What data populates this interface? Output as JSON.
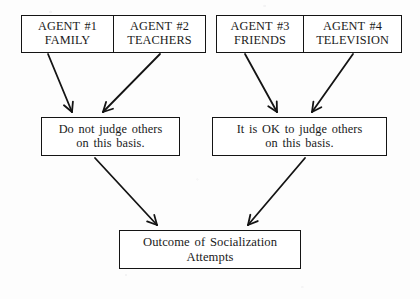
{
  "diagram": {
    "background_color": "#fdfdfd",
    "line_color": "#141414",
    "text_color": "#1a1a1a",
    "agents": [
      {
        "id": "agent-1",
        "label_top": "AGENT #1",
        "label_bottom": "FAMILY",
        "x": 21,
        "y": 15,
        "width": 93,
        "height": 38
      },
      {
        "id": "agent-2",
        "label_top": "AGENT #2",
        "label_bottom": "TEACHERS",
        "x": 113,
        "y": 15,
        "width": 93,
        "height": 38
      },
      {
        "id": "agent-3",
        "label_top": "AGENT #3",
        "label_bottom": "FRIENDS",
        "x": 216,
        "y": 15,
        "width": 88,
        "height": 38
      },
      {
        "id": "agent-4",
        "label_top": "AGENT #4",
        "label_bottom": "TELEVISION",
        "x": 303,
        "y": 15,
        "width": 99,
        "height": 38
      }
    ],
    "rules": [
      {
        "id": "rule-do-not-judge",
        "line_top": "Do not judge others",
        "line_bottom": "on this basis.",
        "x": 41,
        "y": 117,
        "width": 139,
        "height": 39
      },
      {
        "id": "rule-ok-to-judge",
        "line_top": "It is OK to judge others",
        "line_bottom": "on this basis.",
        "x": 212,
        "y": 117,
        "width": 175,
        "height": 39
      }
    ],
    "outcome": {
      "id": "outcome-socialization",
      "line_top": "Outcome of Socialization",
      "line_bottom": "Attempts",
      "x": 119,
      "y": 230,
      "width": 182,
      "height": 39
    },
    "arrows": [
      {
        "id": "arrow-agent1-to-rule-left",
        "from": "agent-1",
        "to": "rule-do-not-judge",
        "x1": 48,
        "y1": 54,
        "x2": 72,
        "y2": 112
      },
      {
        "id": "arrow-agent2-to-rule-left",
        "from": "agent-2",
        "to": "rule-do-not-judge",
        "x1": 160,
        "y1": 54,
        "x2": 103,
        "y2": 112
      },
      {
        "id": "arrow-agent3-to-rule-right",
        "from": "agent-3",
        "to": "rule-ok-to-judge",
        "x1": 245,
        "y1": 54,
        "x2": 277,
        "y2": 112
      },
      {
        "id": "arrow-agent4-to-rule-right",
        "from": "agent-4",
        "to": "rule-ok-to-judge",
        "x1": 353,
        "y1": 54,
        "x2": 312,
        "y2": 112
      },
      {
        "id": "arrow-rule-left-to-outcome",
        "from": "rule-do-not-judge",
        "to": "outcome-socialization",
        "x1": 95,
        "y1": 158,
        "x2": 157,
        "y2": 225
      },
      {
        "id": "arrow-rule-right-to-outcome",
        "from": "rule-ok-to-judge",
        "to": "outcome-socialization",
        "x1": 305,
        "y1": 158,
        "x2": 248,
        "y2": 225
      }
    ]
  }
}
